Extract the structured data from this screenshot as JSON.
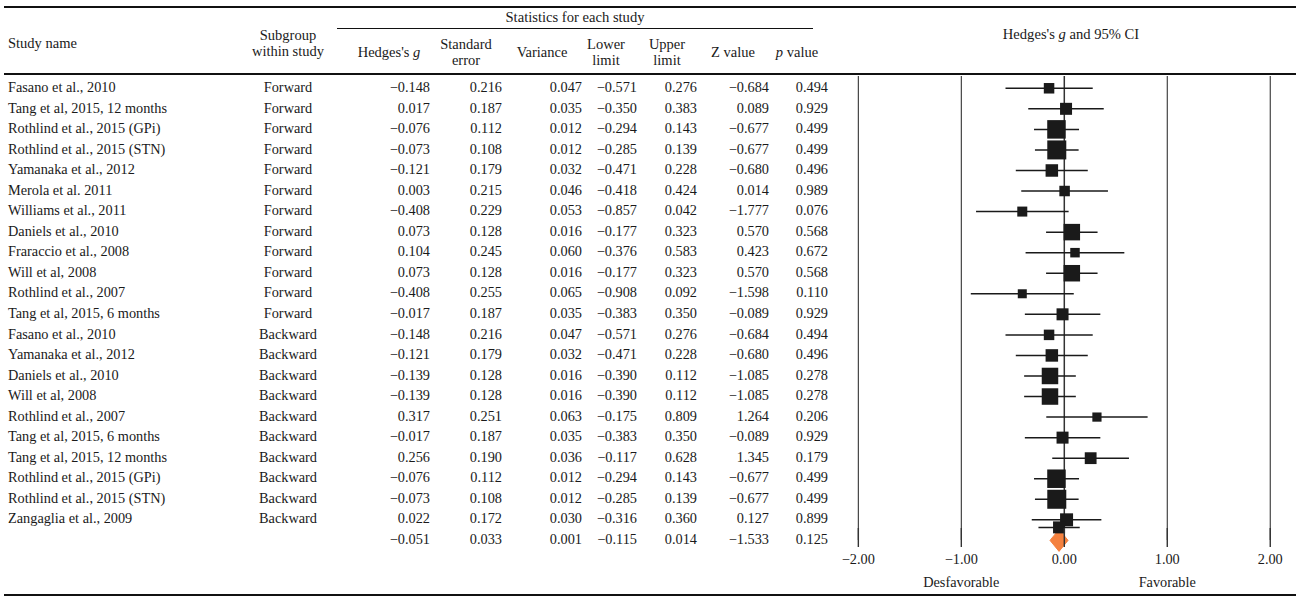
{
  "header": {
    "study_name": "Study name",
    "subgroup_line1": "Subgroup",
    "subgroup_line2": "within study",
    "stats_group": "Statistics for each study",
    "hedges_g": "Hedges's g",
    "standard_line1": "Standard",
    "standard_line2": "error",
    "variance": "Variance",
    "lower_line1": "Lower",
    "lower_line2": "limit",
    "upper_line1": "Upper",
    "upper_line2": "limit",
    "z_value": "Z value",
    "p_value": "p value",
    "plot_title": "Hedges's g and 95% CI"
  },
  "axis": {
    "ticks": [
      "-2.00",
      "-1.00",
      "0.00",
      "1.00",
      "2.00"
    ],
    "tick_values": [
      -2,
      -1,
      0,
      1,
      2
    ],
    "left_label": "Desfavorable",
    "right_label": "Favorable",
    "min": -2.45,
    "max": 2.25
  },
  "colors": {
    "marker": "#1a1a1a",
    "summary_diamond": "#f4813f",
    "rule": "#111111",
    "gridline": "#333333"
  },
  "chart_data": {
    "type": "forest",
    "title": "Hedges's g and 95% CI",
    "xlabel": "",
    "ylabel": "",
    "xlim": [
      -2.45,
      2.25
    ],
    "xticks": [
      -2,
      -1,
      0,
      1,
      2
    ],
    "grid": true,
    "null_line": 0,
    "columns": [
      "Study name",
      "Subgroup within study",
      "Hedges's g",
      "Standard error",
      "Variance",
      "Lower limit",
      "Upper limit",
      "Z value",
      "p value"
    ],
    "rows": [
      {
        "study": "Fasano et al., 2010",
        "subgroup": "Forward",
        "g": "−0.148",
        "se": "0.216",
        "var": "0.047",
        "ll": "−0.571",
        "ul": "0.276",
        "z": "−0.684",
        "p": "0.494",
        "g_v": -0.148,
        "ll_v": -0.571,
        "ul_v": 0.276,
        "w": 10.5
      },
      {
        "study": "Tang et al, 2015, 12 months",
        "subgroup": "Forward",
        "g": "0.017",
        "se": "0.187",
        "var": "0.035",
        "ll": "−0.350",
        "ul": "0.383",
        "z": "0.089",
        "p": "0.929",
        "g_v": 0.017,
        "ll_v": -0.35,
        "ul_v": 0.383,
        "w": 12.0
      },
      {
        "study": "Rothlind et al., 2015 (GPi)",
        "subgroup": "Forward",
        "g": "−0.076",
        "se": "0.112",
        "var": "0.012",
        "ll": "−0.294",
        "ul": "0.143",
        "z": "−0.677",
        "p": "0.499",
        "g_v": -0.076,
        "ll_v": -0.294,
        "ul_v": 0.143,
        "w": 18.5
      },
      {
        "study": "Rothlind et al., 2015 (STN)",
        "subgroup": "Forward",
        "g": "−0.073",
        "se": "0.108",
        "var": "0.012",
        "ll": "−0.285",
        "ul": "0.139",
        "z": "−0.677",
        "p": "0.499",
        "g_v": -0.073,
        "ll_v": -0.285,
        "ul_v": 0.139,
        "w": 19.0
      },
      {
        "study": "Yamanaka et al., 2012",
        "subgroup": "Forward",
        "g": "−0.121",
        "se": "0.179",
        "var": "0.032",
        "ll": "−0.471",
        "ul": "0.228",
        "z": "−0.680",
        "p": "0.496",
        "g_v": -0.121,
        "ll_v": -0.471,
        "ul_v": 0.228,
        "w": 12.5
      },
      {
        "study": "Merola et al. 2011",
        "subgroup": "Forward",
        "g": "0.003",
        "se": "0.215",
        "var": "0.046",
        "ll": "−0.418",
        "ul": "0.424",
        "z": "0.014",
        "p": "0.989",
        "g_v": 0.003,
        "ll_v": -0.418,
        "ul_v": 0.424,
        "w": 10.5
      },
      {
        "study": "Williams et al., 2011",
        "subgroup": "Forward",
        "g": "−0.408",
        "se": "0.229",
        "var": "0.053",
        "ll": "−0.857",
        "ul": "0.042",
        "z": "−1.777",
        "p": "0.076",
        "g_v": -0.408,
        "ll_v": -0.857,
        "ul_v": 0.042,
        "w": 10.0
      },
      {
        "study": "Daniels et al., 2010",
        "subgroup": "Forward",
        "g": "0.073",
        "se": "0.128",
        "var": "0.016",
        "ll": "−0.177",
        "ul": "0.323",
        "z": "0.570",
        "p": "0.568",
        "g_v": 0.073,
        "ll_v": -0.177,
        "ul_v": 0.323,
        "w": 16.5
      },
      {
        "study": "Fraraccio et al., 2008",
        "subgroup": "Forward",
        "g": "0.104",
        "se": "0.245",
        "var": "0.060",
        "ll": "−0.376",
        "ul": "0.583",
        "z": "0.423",
        "p": "0.672",
        "g_v": 0.104,
        "ll_v": -0.376,
        "ul_v": 0.583,
        "w": 9.5
      },
      {
        "study": "Will et al, 2008",
        "subgroup": "Forward",
        "g": "0.073",
        "se": "0.128",
        "var": "0.016",
        "ll": "−0.177",
        "ul": "0.323",
        "z": "0.570",
        "p": "0.568",
        "g_v": 0.073,
        "ll_v": -0.177,
        "ul_v": 0.323,
        "w": 16.5
      },
      {
        "study": "Rothlind et al., 2007",
        "subgroup": "Forward",
        "g": "−0.408",
        "se": "0.255",
        "var": "0.065",
        "ll": "−0.908",
        "ul": "0.092",
        "z": "−1.598",
        "p": "0.110",
        "g_v": -0.408,
        "ll_v": -0.908,
        "ul_v": 0.092,
        "w": 9.0
      },
      {
        "study": "Tang et al, 2015, 6 months",
        "subgroup": "Forward",
        "g": "−0.017",
        "se": "0.187",
        "var": "0.035",
        "ll": "−0.383",
        "ul": "0.350",
        "z": "−0.089",
        "p": "0.929",
        "g_v": -0.017,
        "ll_v": -0.383,
        "ul_v": 0.35,
        "w": 12.0
      },
      {
        "study": "Fasano et al., 2010",
        "subgroup": "Backward",
        "g": "−0.148",
        "se": "0.216",
        "var": "0.047",
        "ll": "−0.571",
        "ul": "0.276",
        "z": "−0.684",
        "p": "0.494",
        "g_v": -0.148,
        "ll_v": -0.571,
        "ul_v": 0.276,
        "w": 10.5
      },
      {
        "study": "Yamanaka et al., 2012",
        "subgroup": "Backward",
        "g": "−0.121",
        "se": "0.179",
        "var": "0.032",
        "ll": "−0.471",
        "ul": "0.228",
        "z": "−0.680",
        "p": "0.496",
        "g_v": -0.121,
        "ll_v": -0.471,
        "ul_v": 0.228,
        "w": 12.5
      },
      {
        "study": "Daniels et al., 2010",
        "subgroup": "Backward",
        "g": "−0.139",
        "se": "0.128",
        "var": "0.016",
        "ll": "−0.390",
        "ul": "0.112",
        "z": "−1.085",
        "p": "0.278",
        "g_v": -0.139,
        "ll_v": -0.39,
        "ul_v": 0.112,
        "w": 16.5
      },
      {
        "study": "Will et al, 2008",
        "subgroup": "Backward",
        "g": "−0.139",
        "se": "0.128",
        "var": "0.016",
        "ll": "−0.390",
        "ul": "0.112",
        "z": "−1.085",
        "p": "0.278",
        "g_v": -0.139,
        "ll_v": -0.39,
        "ul_v": 0.112,
        "w": 16.5
      },
      {
        "study": "Rothlind et al., 2007",
        "subgroup": "Backward",
        "g": "0.317",
        "se": "0.251",
        "var": "0.063",
        "ll": "−0.175",
        "ul": "0.809",
        "z": "1.264",
        "p": "0.206",
        "g_v": 0.317,
        "ll_v": -0.175,
        "ul_v": 0.809,
        "w": 9.2
      },
      {
        "study": "Tang et al, 2015, 6 months",
        "subgroup": "Backward",
        "g": "−0.017",
        "se": "0.187",
        "var": "0.035",
        "ll": "−0.383",
        "ul": "0.350",
        "z": "−0.089",
        "p": "0.929",
        "g_v": -0.017,
        "ll_v": -0.383,
        "ul_v": 0.35,
        "w": 12.0
      },
      {
        "study": "Tang et al, 2015, 12 months",
        "subgroup": "Backward",
        "g": "0.256",
        "se": "0.190",
        "var": "0.036",
        "ll": "−0.117",
        "ul": "0.628",
        "z": "1.345",
        "p": "0.179",
        "g_v": 0.256,
        "ll_v": -0.117,
        "ul_v": 0.628,
        "w": 11.8
      },
      {
        "study": "Rothlind et al., 2015 (GPi)",
        "subgroup": "Backward",
        "g": "−0.076",
        "se": "0.112",
        "var": "0.012",
        "ll": "−0.294",
        "ul": "0.143",
        "z": "−0.677",
        "p": "0.499",
        "g_v": -0.076,
        "ll_v": -0.294,
        "ul_v": 0.143,
        "w": 18.5
      },
      {
        "study": "Rothlind et al., 2015 (STN)",
        "subgroup": "Backward",
        "g": "−0.073",
        "se": "0.108",
        "var": "0.012",
        "ll": "−0.285",
        "ul": "0.139",
        "z": "−0.677",
        "p": "0.499",
        "g_v": -0.073,
        "ll_v": -0.285,
        "ul_v": 0.139,
        "w": 19.0
      },
      {
        "study": "Zangaglia et al., 2009",
        "subgroup": "Backward",
        "g": "0.022",
        "se": "0.172",
        "var": "0.030",
        "ll": "−0.316",
        "ul": "0.360",
        "z": "0.127",
        "p": "0.899",
        "g_v": 0.022,
        "ll_v": -0.316,
        "ul_v": 0.36,
        "w": 13.0
      },
      {
        "study": "",
        "subgroup": "",
        "g": "−0.051",
        "se": "0.033",
        "var": "0.001",
        "ll": "−0.115",
        "ul": "0.014",
        "z": "−1.533",
        "p": "0.125",
        "g_v": -0.051,
        "ll_v": -0.115,
        "ul_v": 0.014,
        "w": 0,
        "summary": true
      }
    ]
  }
}
